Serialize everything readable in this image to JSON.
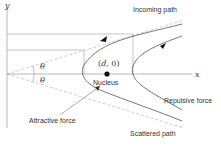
{
  "diagram": {
    "axis_labels": {
      "x": "x",
      "y": "y"
    },
    "angle_upper": "θ",
    "angle_lower": "θ",
    "point_label": "(d, 0)",
    "point_label_parts": {
      "open": "(",
      "d": "d",
      "rest": ", 0)"
    },
    "nucleus_label": "Nucleus",
    "incoming_label": "Incoming path",
    "repulsive_label": "Repulsive force",
    "attractive_label": "Attractive force",
    "scattered_label": "Scattered path",
    "colors": {
      "line": "#555555",
      "dashed": "#aaaaaa",
      "thin": "#888888",
      "nucleus": "#111111"
    }
  }
}
